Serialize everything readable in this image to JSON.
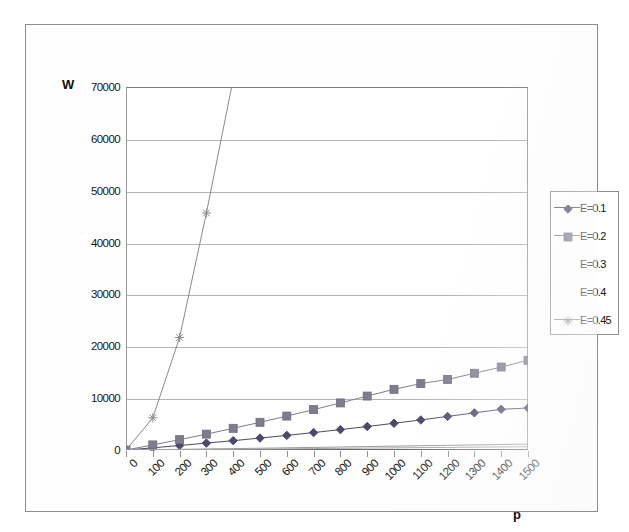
{
  "figure": {
    "y_axis_title": "W",
    "x_axis_title": "p"
  },
  "chart_data": {
    "type": "line",
    "title": "",
    "xlabel": "p",
    "ylabel": "W",
    "xlim": [
      0,
      1500
    ],
    "ylim": [
      0,
      70000
    ],
    "ytick_labels": [
      "70000",
      "60000",
      "50000",
      "40000",
      "30000",
      "20000",
      "10000",
      "0"
    ],
    "ytick_values": [
      70000,
      60000,
      50000,
      40000,
      30000,
      20000,
      10000,
      0
    ],
    "xtick_labels": [
      "0",
      "100",
      "200",
      "300",
      "400",
      "500",
      "600",
      "700",
      "800",
      "900",
      "1000",
      "1100",
      "1200",
      "1300",
      "1400",
      "1500"
    ],
    "x": [
      0,
      100,
      200,
      300,
      400,
      500,
      600,
      700,
      800,
      900,
      1000,
      1100,
      1200,
      1300,
      1400,
      1500
    ],
    "grid": "horizontal",
    "legend_position": "right",
    "series": [
      {
        "name": "E=0.1",
        "marker": "diamond",
        "color": "#4a4a6a",
        "values": [
          0,
          420,
          870,
          1330,
          1800,
          2300,
          2820,
          3360,
          3930,
          4530,
          5150,
          5800,
          6470,
          7160,
          7850,
          8100
        ]
      },
      {
        "name": "E=0.2",
        "marker": "square",
        "color": "#7d7d8e",
        "values": [
          0,
          980,
          2000,
          3060,
          4180,
          5340,
          6540,
          7790,
          9080,
          10400,
          11700,
          12800,
          13600,
          14800,
          16000,
          17300
        ]
      },
      {
        "name": "E=0.3",
        "marker": "none",
        "color": "#9a9a9a",
        "values": [
          0,
          60,
          130,
          200,
          270,
          340,
          420,
          500,
          580,
          660,
          740,
          820,
          900,
          980,
          1060,
          1140
        ]
      },
      {
        "name": "E=0.4",
        "marker": "none",
        "color": "#a8a8a8",
        "values": [
          0,
          30,
          70,
          110,
          150,
          190,
          230,
          280,
          320,
          370,
          410,
          460,
          500,
          550,
          590,
          640
        ]
      },
      {
        "name": "E=0.45",
        "marker": "star",
        "color": "#8a8a8a",
        "values": [
          0,
          6200,
          21700,
          45700,
          71500,
          null,
          null,
          null,
          null,
          null,
          null,
          null,
          null,
          null,
          null,
          null
        ]
      }
    ]
  }
}
